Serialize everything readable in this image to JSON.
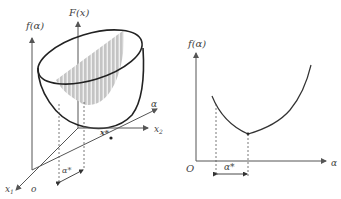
{
  "left_diagram": {
    "label_f_alpha": "f(α)",
    "label_F_x": "F(x)",
    "label_alpha_axis": "α",
    "label_x2": "x",
    "label_x2_sub": "2",
    "label_x1": "x",
    "label_x1_sub": "1",
    "label_origin": "o",
    "label_xstar": "x*",
    "label_alpha_star": "α*"
  },
  "right_diagram": {
    "label_f_alpha": "f(α)",
    "label_alpha_axis": "α",
    "label_origin": "O",
    "label_alpha_star": "α*"
  },
  "colors": {
    "line": "#333333",
    "shade": "#bdbdbd",
    "axis": "#555555"
  }
}
